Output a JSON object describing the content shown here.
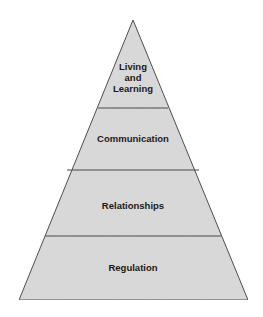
{
  "diagram": {
    "type": "pyramid",
    "levels_top_to_bottom": [
      {
        "id": "living-and-learning",
        "label_lines": [
          "Living",
          "and",
          "Learning"
        ]
      },
      {
        "id": "communication",
        "label_lines": [
          "Communication"
        ]
      },
      {
        "id": "relationships",
        "label_lines": [
          "Relationships"
        ]
      },
      {
        "id": "regulation",
        "label_lines": [
          "Regulation"
        ]
      }
    ],
    "colors": {
      "fill": "#d9d9d9",
      "stroke": "#4a4a4a",
      "text": "#1a1a1a"
    }
  }
}
